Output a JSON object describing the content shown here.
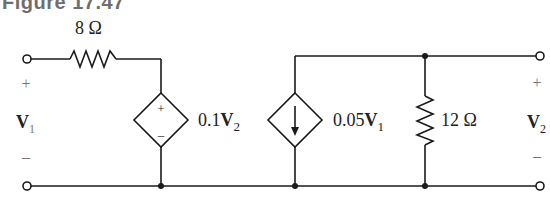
{
  "title": "Figure 17.47",
  "components": {
    "series_resistor": {
      "label": "8 Ω"
    },
    "vcvs": {
      "label_coef": "0.1",
      "label_var": "V",
      "label_sub": "2",
      "plus": "+",
      "minus": "–"
    },
    "vccs": {
      "label_coef": "0.05",
      "label_var": "V",
      "label_sub": "1"
    },
    "shunt_resistor": {
      "label": "12 Ω"
    }
  },
  "ports": {
    "input": {
      "plus": "+",
      "var": "V",
      "sub": "1",
      "minus": "–"
    },
    "output": {
      "plus": "+",
      "var": "V",
      "sub": "2",
      "minus": "–"
    }
  },
  "colors": {
    "wire": "#1a1a1a",
    "title": "#6e6e6e",
    "sign": "#777777"
  }
}
